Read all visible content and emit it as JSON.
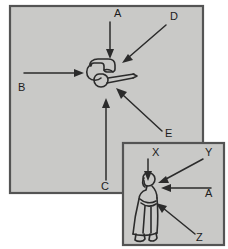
{
  "diagram": {
    "background_color": "#ffffff",
    "panel_fill_color": "#c9c9c7",
    "panel_border_color": "#545454",
    "ink_color": "#2b2b2b"
  },
  "main_panel": {
    "name": "main-panel",
    "subject": "figure-top-view",
    "labels": [
      {
        "id": "A",
        "text": "A",
        "x": 114,
        "y": 17,
        "arrow_from": [
          110,
          22
        ],
        "arrow_to": [
          110,
          58
        ],
        "direction": "down"
      },
      {
        "id": "B",
        "text": "B",
        "x": 18,
        "y": 91,
        "arrow_from": [
          24,
          73
        ],
        "arrow_to": [
          84,
          73
        ],
        "direction": "right"
      },
      {
        "id": "C",
        "text": "C",
        "x": 101,
        "y": 190,
        "arrow_from": [
          106,
          180
        ],
        "arrow_to": [
          106,
          98
        ],
        "direction": "up"
      },
      {
        "id": "D",
        "text": "D",
        "x": 170,
        "y": 20,
        "arrow_from": [
          166,
          25
        ],
        "arrow_to": [
          122,
          63
        ],
        "direction": "down-left"
      },
      {
        "id": "E",
        "text": "E",
        "x": 165,
        "y": 137,
        "arrow_from": [
          162,
          131
        ],
        "arrow_to": [
          116,
          88
        ],
        "direction": "up-left"
      }
    ]
  },
  "inset_panel": {
    "name": "inset-panel",
    "subject": "figure-side-view",
    "labels": [
      {
        "id": "X",
        "text": "X",
        "x": 152,
        "y": 155,
        "arrow_from": [
          148,
          159
        ],
        "arrow_to": [
          148,
          180
        ],
        "direction": "down"
      },
      {
        "id": "Y",
        "text": "Y",
        "x": 205,
        "y": 155,
        "arrow_from": [
          203,
          159
        ],
        "arrow_to": [
          158,
          183
        ],
        "direction": "down-left"
      },
      {
        "id": "A",
        "text": "A",
        "x": 207,
        "y": 196,
        "arrow_from": [
          211,
          188
        ],
        "arrow_to": [
          161,
          188
        ],
        "direction": "left"
      },
      {
        "id": "Z",
        "text": "Z",
        "x": 198,
        "y": 240,
        "arrow_from": [
          195,
          234
        ],
        "arrow_to": [
          156,
          203
        ],
        "direction": "up-left"
      }
    ]
  }
}
